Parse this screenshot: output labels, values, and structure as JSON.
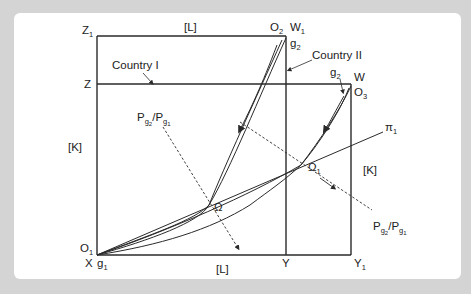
{
  "diagram": {
    "type": "Edgeworth box (two-country trade equilibrium)",
    "axis_labels": {
      "top_L": "[L]",
      "bottom_L": "[L]",
      "left_K": "[K]",
      "right_K": "[K]"
    },
    "corner_labels": {
      "Z1": "Z",
      "Z1_sub": "1",
      "Z": "Z",
      "O2": "O",
      "O2_sub": "2",
      "W1": "W",
      "W1_sub": "1",
      "g2_top": "g",
      "g2_top_sub": "2",
      "g2_right": "g",
      "g2_right_sub": "2",
      "W": "W",
      "O3": "O",
      "O3_sub": "3",
      "O1": "O",
      "O1_sub": "1",
      "X": "X",
      "g1": "g",
      "g1_sub": "1",
      "Y": "Y",
      "Y1": "Y",
      "Y1_sub": "1"
    },
    "country_labels": {
      "country1": "Country I",
      "country2": "Country II"
    },
    "price_ratio_labels": {
      "left": {
        "P": "P",
        "num_sub": "g",
        "num_subsub": "2",
        "slash": "/P",
        "den_sub": "g",
        "den_subsub": "1"
      },
      "right": {
        "P": "P",
        "num_sub": "g",
        "num_subsub": "2",
        "slash": "/P",
        "den_sub": "g",
        "den_subsub": "1"
      }
    },
    "points": {
      "omega": "Ω",
      "omega1": "Ω",
      "omega1_sub": "1",
      "pi1": "π",
      "pi1_sub": "1"
    },
    "colors": {
      "background": "#d4d4d4",
      "panel": "#ffffff",
      "line": "#2a2a2a"
    }
  }
}
